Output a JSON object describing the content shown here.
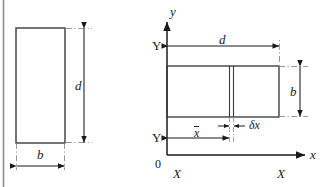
{
  "figure": {
    "title_visible": false,
    "type": "engineering-dimension-diagram",
    "line_color": "#1a1a1a",
    "background_color": "#ffffff",
    "frame_color": "#8c8c8c"
  },
  "left_figure": {
    "name": "rectangular-section",
    "depth_label": "d",
    "width_label": "b",
    "rect": {
      "x": 16,
      "y": 28,
      "w": 49,
      "h": 115
    }
  },
  "right_figure": {
    "name": "rotated-section-with-axes",
    "axis_y_label": "y",
    "axis_x_label": "x",
    "origin_label": "0",
    "neutral_axis_left_label": "Y",
    "neutral_axis_lower_label": "Y",
    "centroid_axis_left_label": "X",
    "centroid_axis_right_label": "X",
    "depth_label": "d",
    "breadth_label": "b",
    "centroid_distance_label": "x",
    "centroid_distance_overbar": true,
    "strip_width_label": "δx",
    "rect": {
      "x": 167,
      "y": 66,
      "w": 112,
      "h": 51
    },
    "strip": {
      "x": 229,
      "w": 4
    }
  }
}
